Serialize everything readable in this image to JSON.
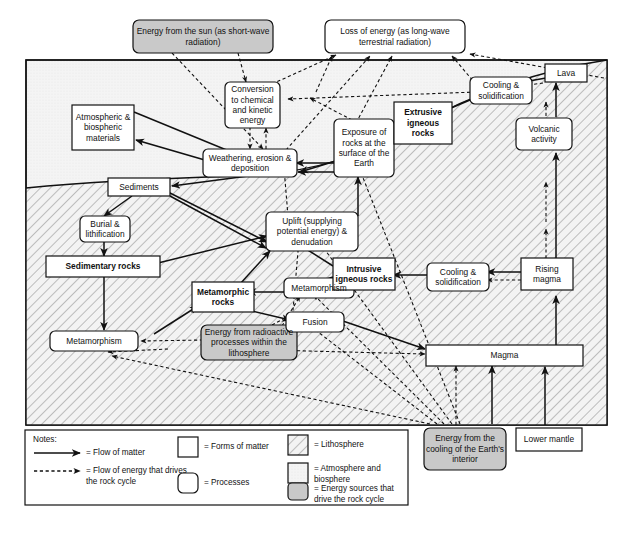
{
  "diagram": {
    "title": "The rock cycle",
    "colors": {
      "lithosphere_fill": "#f2f2f2",
      "lithosphere_hatch": "#8a8a8a",
      "atmosphere_fill": "#f0f0f0",
      "energy_box_fill": "#c9c9c9",
      "box_fill": "#ffffff",
      "stroke": "#1a1a1a"
    },
    "energy_sources": [
      {
        "id": "sun",
        "label": "Energy from the sun (as short-wave radiation)",
        "type": "energy"
      },
      {
        "id": "cooling-interior",
        "label": "Energy from the cooling of the Earth's interior",
        "type": "energy"
      },
      {
        "id": "radioactive",
        "label": "Energy from radioactive processes within the lithosphere",
        "type": "energy"
      }
    ],
    "nodes": [
      {
        "id": "loss-of-energy",
        "label": "Loss of energy (as long-wave terrestrial radiation)",
        "type": "process"
      },
      {
        "id": "conversion",
        "label": "Conversion to chemical and kinetic energy",
        "type": "process"
      },
      {
        "id": "atmospheric-materials",
        "label": "Atmospheric & biospheric materials",
        "type": "matter"
      },
      {
        "id": "weathering",
        "label": "Weathering, erosion & deposition",
        "type": "process"
      },
      {
        "id": "sediments",
        "label": "Sediments",
        "type": "matter"
      },
      {
        "id": "burial",
        "label": "Burial & lithification",
        "type": "process"
      },
      {
        "id": "sedimentary-rocks",
        "label": "Sedimentary rocks",
        "type": "matter",
        "bold": true
      },
      {
        "id": "metamorphism-left",
        "label": "Metamorphism",
        "type": "process"
      },
      {
        "id": "metamorphic-rocks",
        "label": "Metamorphic rocks",
        "type": "matter",
        "bold": true
      },
      {
        "id": "uplift",
        "label": "Uplift (supplying potential energy) & denudation",
        "type": "process"
      },
      {
        "id": "exposure",
        "label": "Exposure of rocks at the surface of the Earth",
        "type": "process"
      },
      {
        "id": "extrusive-rocks",
        "label": "Extrusive igneous rocks",
        "type": "matter",
        "bold": true
      },
      {
        "id": "cooling-top",
        "label": "Cooling & solidification",
        "type": "process"
      },
      {
        "id": "lava",
        "label": "Lava",
        "type": "matter"
      },
      {
        "id": "volcanic-activity",
        "label": "Volcanic activity",
        "type": "process"
      },
      {
        "id": "metamorphism-mid",
        "label": "Metamorphism",
        "type": "process"
      },
      {
        "id": "intrusive-rocks",
        "label": "Intrusive igneous rocks",
        "type": "matter",
        "bold": true
      },
      {
        "id": "cooling-mid",
        "label": "Cooling & solidification",
        "type": "process"
      },
      {
        "id": "rising-magma",
        "label": "Rising magma",
        "type": "matter"
      },
      {
        "id": "fusion",
        "label": "Fusion",
        "type": "process"
      },
      {
        "id": "magma",
        "label": "Magma",
        "type": "matter"
      },
      {
        "id": "lower-mantle",
        "label": "Lower mantle",
        "type": "matter"
      }
    ],
    "legend": {
      "notes_label": "Notes:",
      "items": [
        {
          "key": "solid-arrow",
          "label": "= Flow of matter"
        },
        {
          "key": "dashed-arrow",
          "label": "= Flow of energy that drives the rock cycle"
        },
        {
          "key": "square-plain",
          "label": "= Forms of matter"
        },
        {
          "key": "rounded-plain",
          "label": "= Processes"
        },
        {
          "key": "swatch-hatch",
          "label": "= Lithosphere"
        },
        {
          "key": "swatch-light",
          "label": "= Atmosphere and biosphere"
        },
        {
          "key": "swatch-grey",
          "label": "= Energy sources that drive the rock cycle"
        }
      ]
    }
  }
}
